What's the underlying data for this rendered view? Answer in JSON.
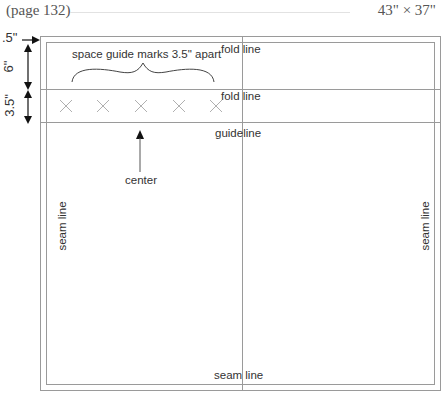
{
  "header": {
    "page_ref": "(page 132)",
    "dimensions": "43\" × 37\""
  },
  "measurements": {
    "top_margin": ".5\"",
    "upper_section": "6\"",
    "guide_section": "3.5\""
  },
  "annotations": {
    "spacing_note": "space guide marks 3.5\" apart",
    "center": "center"
  },
  "lines": {
    "fold_line_1": "fold line",
    "fold_line_2": "fold line",
    "guideline": "guideline",
    "seam_left": "seam line",
    "seam_right": "seam line",
    "seam_bottom": "seam line"
  },
  "guide_marks": {
    "count": 5,
    "symbol": "x-mark",
    "color": "#b0b0b0"
  },
  "colors": {
    "line": "#9a9a9a",
    "text": "#333333",
    "arrow": "#111111"
  }
}
